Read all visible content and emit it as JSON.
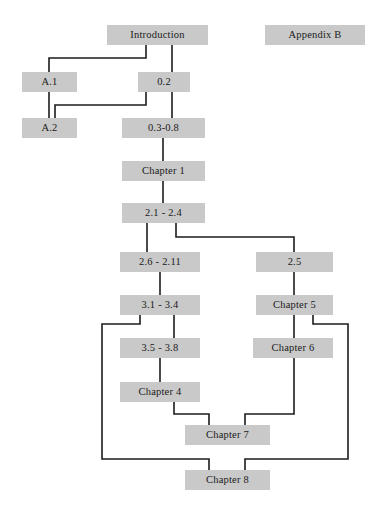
{
  "diagram": {
    "canvas": {
      "width": 389,
      "height": 516
    },
    "style": {
      "node_fill": "#c9c9c9",
      "node_text": "#1a1a1a",
      "edge_color": "#1c1c1c",
      "background": "#ffffff",
      "edge_width": 1.6
    },
    "nodes": [
      {
        "id": "introduction",
        "label": "Introduction",
        "x": 107,
        "y": 25,
        "w": 101,
        "h": 20
      },
      {
        "id": "appendix-b",
        "label": "Appendix B",
        "x": 265,
        "y": 25,
        "w": 100,
        "h": 20
      },
      {
        "id": "a1",
        "label": "A.1",
        "x": 22,
        "y": 72,
        "w": 55,
        "h": 20
      },
      {
        "id": "s02",
        "label": "0.2",
        "x": 138,
        "y": 72,
        "w": 52,
        "h": 20
      },
      {
        "id": "a2",
        "label": "A.2",
        "x": 22,
        "y": 118,
        "w": 55,
        "h": 20
      },
      {
        "id": "s03-08",
        "label": "0.3-0.8",
        "x": 122,
        "y": 118,
        "w": 83,
        "h": 20
      },
      {
        "id": "chapter1",
        "label": "Chapter 1",
        "x": 122,
        "y": 161,
        "w": 83,
        "h": 20
      },
      {
        "id": "s21-24",
        "label": "2.1 - 2.4",
        "x": 122,
        "y": 203,
        "w": 83,
        "h": 20
      },
      {
        "id": "s26-211",
        "label": "2.6 - 2.11",
        "x": 120,
        "y": 252,
        "w": 80,
        "h": 20
      },
      {
        "id": "s25",
        "label": "2.5",
        "x": 256,
        "y": 252,
        "w": 77,
        "h": 20
      },
      {
        "id": "s31-34",
        "label": "3.1 - 3.4",
        "x": 120,
        "y": 295,
        "w": 80,
        "h": 20
      },
      {
        "id": "chapter5",
        "label": "Chapter 5",
        "x": 256,
        "y": 295,
        "w": 77,
        "h": 20
      },
      {
        "id": "s35-38",
        "label": "3.5 - 3.8",
        "x": 120,
        "y": 338,
        "w": 80,
        "h": 20
      },
      {
        "id": "chapter6",
        "label": "Chapter 6",
        "x": 253,
        "y": 338,
        "w": 80,
        "h": 20
      },
      {
        "id": "chapter4",
        "label": "Chapter 4",
        "x": 120,
        "y": 382,
        "w": 80,
        "h": 20
      },
      {
        "id": "chapter7",
        "label": "Chapter 7",
        "x": 185,
        "y": 425,
        "w": 85,
        "h": 20
      },
      {
        "id": "chapter8",
        "label": "Chapter 8",
        "x": 185,
        "y": 470,
        "w": 85,
        "h": 20
      }
    ],
    "edges": [
      {
        "from": "introduction",
        "to": "a1",
        "path": "M146,45 L146,58 L49,58 L49,72"
      },
      {
        "from": "introduction",
        "to": "s02",
        "path": "M172,45 L172,72"
      },
      {
        "from": "a1",
        "to": "a2",
        "path": "M49,92 L49,118"
      },
      {
        "from": "s02",
        "to": "a2",
        "path": "M146,92 L146,105 L55,105 L55,118"
      },
      {
        "from": "s02",
        "to": "s03-08",
        "path": "M172,92 L172,118"
      },
      {
        "from": "s03-08",
        "to": "chapter1",
        "path": "M163,138 L163,161"
      },
      {
        "from": "chapter1",
        "to": "s21-24",
        "path": "M163,181 L163,203"
      },
      {
        "from": "s21-24",
        "to": "s26-211",
        "path": "M147,223 L147,252"
      },
      {
        "from": "s21-24",
        "to": "s25",
        "path": "M176,223 L176,237 L294,237 L294,252"
      },
      {
        "from": "s26-211",
        "to": "s31-34",
        "path": "M160,272 L160,295"
      },
      {
        "from": "s25",
        "to": "chapter5",
        "path": "M294,272 L294,295"
      },
      {
        "from": "s31-34",
        "to": "s35-38",
        "path": "M174,315 L174,338"
      },
      {
        "from": "s31-34",
        "to": "chapter8",
        "path": "M140,315 L140,324 L102,324 L102,459 L209,459 L209,470"
      },
      {
        "from": "chapter5",
        "to": "chapter6",
        "path": "M294,315 L294,338"
      },
      {
        "from": "chapter5",
        "to": "chapter8",
        "path": "M313,315 L313,324 L348,324 L348,459 L245,459 L245,470"
      },
      {
        "from": "s35-38",
        "to": "chapter4",
        "path": "M160,358 L160,382"
      },
      {
        "from": "chapter4",
        "to": "chapter7",
        "path": "M174,402 L174,414 L209,414 L209,425"
      },
      {
        "from": "chapter6",
        "to": "chapter7",
        "path": "M294,358 L294,414 L245,414 L245,425"
      }
    ]
  }
}
